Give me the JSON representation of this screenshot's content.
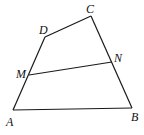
{
  "diagram": {
    "points": {
      "A": {
        "label": "A",
        "x": 13,
        "y": 110,
        "lx": 6,
        "ly": 126
      },
      "B": {
        "label": "B",
        "x": 132,
        "y": 108,
        "lx": 131,
        "ly": 121
      },
      "C": {
        "label": "C",
        "x": 91,
        "y": 16,
        "lx": 86,
        "ly": 13
      },
      "D": {
        "label": "D",
        "x": 45,
        "y": 37,
        "lx": 39,
        "ly": 34
      },
      "M": {
        "label": "M",
        "x": 29,
        "y": 75,
        "lx": 16,
        "ly": 78
      },
      "N": {
        "label": "N",
        "x": 112,
        "y": 62,
        "lx": 114,
        "ly": 62
      }
    },
    "segments": [
      "AB",
      "BC",
      "CD",
      "DA",
      "MN"
    ]
  }
}
